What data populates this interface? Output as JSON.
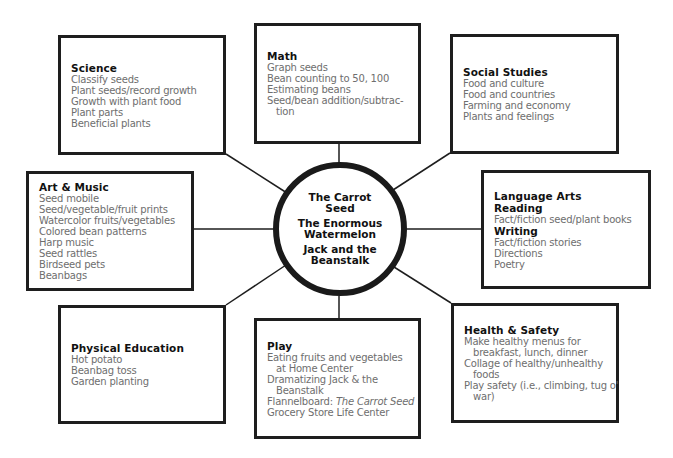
{
  "diagram": {
    "type": "web",
    "hub": {
      "stories": [
        {
          "line1": "The Carrot",
          "line2": "Seed"
        },
        {
          "line1": "The Enormous",
          "line2": "Watermelon"
        },
        {
          "line1": "Jack and the",
          "line2": "Beanstalk"
        }
      ]
    },
    "boxes": {
      "science": {
        "title": "Science",
        "items": [
          "Classify seeds",
          "Plant seeds/record growth",
          "Growth with plant food",
          "Plant parts",
          "Beneficial plants"
        ]
      },
      "math": {
        "title": "Math",
        "items": [
          "Graph seeds",
          "Bean counting to 50, 100",
          "Estimating beans",
          "Seed/bean addition/subtrac-",
          "tion"
        ]
      },
      "social_studies": {
        "title": "Social Studies",
        "items": [
          "Food and culture",
          "Food and countries",
          "Farming and economy",
          "Plants and feelings"
        ]
      },
      "art_music": {
        "title": "Art & Music",
        "items": [
          "Seed mobile",
          "Seed/vegetable/fruit prints",
          "Watercolor fruits/vegetables",
          "Colored bean patterns",
          "Harp music",
          "Seed rattles",
          "Birdseed pets",
          "Beanbags"
        ]
      },
      "language_arts": {
        "title": "Language Arts",
        "reading_label": "Reading",
        "reading_items": [
          "Fact/fiction seed/plant books"
        ],
        "writing_label": "Writing",
        "writing_items": [
          "Fact/fiction stories",
          "Directions",
          "Poetry"
        ]
      },
      "physical_education": {
        "title": "Physical Education",
        "items": [
          "Hot potato",
          "Beanbag toss",
          "Garden planting"
        ]
      },
      "play": {
        "title": "Play",
        "items": [
          "Eating fruits and vegetables",
          "at Home Center",
          "Dramatizing Jack & the",
          "Beanstalk",
          "Flannelboard:",
          "The Carrot Seed",
          "Grocery Store Life Center"
        ]
      },
      "health_safety": {
        "title": "Health & Safety",
        "items": [
          "Make healthy menus for",
          "breakfast, lunch, dinner",
          "Collage of healthy/unhealthy",
          "foods",
          "Play safety (i.e., climbing, tug o'",
          "war)"
        ]
      }
    },
    "colors": {
      "border": "#1e1e1e",
      "title_text": "#111111",
      "item_text": "#6e6e6e",
      "background": "#ffffff"
    }
  }
}
